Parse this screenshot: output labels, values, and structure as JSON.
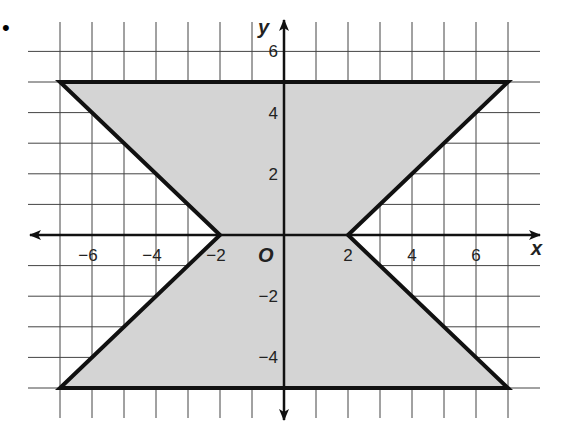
{
  "chart_data": {
    "type": "area",
    "title": "",
    "xlabel": "x",
    "ylabel": "y",
    "origin_label": "O",
    "xlim": [
      -7,
      7
    ],
    "ylim": [
      -5,
      6
    ],
    "grid": true,
    "x_ticks": [
      -6,
      -4,
      -2,
      2,
      4,
      6
    ],
    "y_ticks": [
      6,
      4,
      2,
      -2,
      -4
    ],
    "x_tick_labels": [
      "−6",
      "−4",
      "−2",
      "2",
      "4",
      "6"
    ],
    "y_tick_labels": [
      "6",
      "4",
      "2",
      "−2",
      "−4"
    ],
    "shaded_region": {
      "description": "Shaded region between y = |x| - 2 (upper half: y <= 5) and y = -|x| + 2 (lower half: y >= -5); hourglass shape bounded by y = 5 and y = -5",
      "vertices": [
        [
          -7,
          5
        ],
        [
          7,
          5
        ],
        [
          2,
          0
        ],
        [
          7,
          -5
        ],
        [
          -7,
          -5
        ],
        [
          -2,
          0
        ]
      ],
      "fill_color": "#d4d4d4",
      "stroke_color": "#111111"
    },
    "boundary_lines": [
      {
        "equation": "y = 5",
        "from": [
          -7,
          5
        ],
        "to": [
          7,
          5
        ]
      },
      {
        "equation": "y = -5",
        "from": [
          -7,
          -5
        ],
        "to": [
          7,
          -5
        ]
      },
      {
        "equation": "y = -x - 2",
        "from": [
          -7,
          5
        ],
        "to": [
          -2,
          0
        ]
      },
      {
        "equation": "y = x + 2",
        "from": [
          -2,
          0
        ],
        "to": [
          -7,
          -5
        ]
      },
      {
        "equation": "y = x - 2",
        "from": [
          2,
          0
        ],
        "to": [
          7,
          5
        ]
      },
      {
        "equation": "y = -x + 2",
        "from": [
          2,
          0
        ],
        "to": [
          7,
          -5
        ]
      }
    ]
  },
  "labels": {
    "x_axis": "x",
    "y_axis": "y",
    "origin": "O",
    "bullet": "•"
  }
}
